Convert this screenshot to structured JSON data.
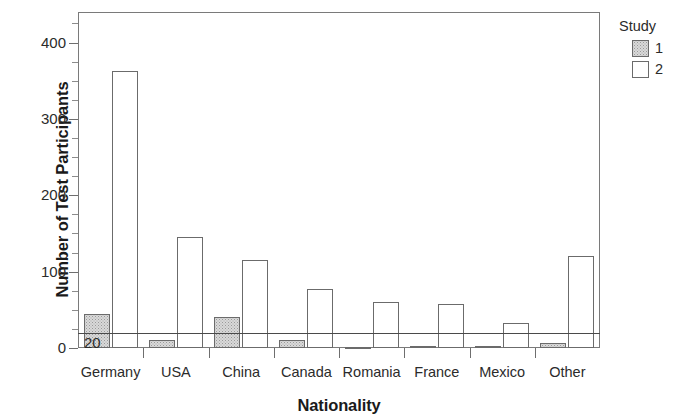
{
  "chart_data": {
    "type": "bar",
    "title": "",
    "xlabel": "Nationality",
    "ylabel": "Number of Test Participants",
    "categories": [
      "Germany",
      "USA",
      "China",
      "Canada",
      "Romania",
      "France",
      "Mexico",
      "Other"
    ],
    "series": [
      {
        "name": "1",
        "values": [
          45,
          11,
          41,
          10,
          1,
          2,
          2,
          6
        ],
        "fill": "#d9d9d9",
        "pattern": "stipple"
      },
      {
        "name": "2",
        "values": [
          363,
          145,
          115,
          77,
          60,
          57,
          33,
          120
        ],
        "fill": "#ffffff",
        "pattern": "solid"
      }
    ],
    "ylim": [
      0,
      440
    ],
    "yticks": [
      0,
      100,
      200,
      300,
      400
    ],
    "ytick_labels": [
      "0",
      "100",
      "200",
      "300",
      "400"
    ],
    "y_minor_tick_step": 25,
    "grid": false,
    "legend": {
      "title": "Study",
      "position": "right",
      "entries": [
        {
          "label": "1",
          "swatch": "study1"
        },
        {
          "label": "2",
          "swatch": "study2"
        }
      ]
    },
    "annotations": [
      {
        "type": "hline",
        "value": 20,
        "label": "20",
        "color": "#4a4a4a"
      }
    ],
    "axis_color": "#7a7a7a",
    "text_color": "#2b2b2b"
  }
}
